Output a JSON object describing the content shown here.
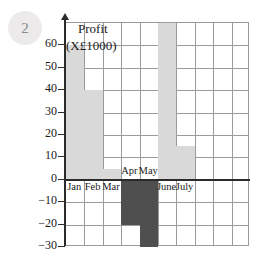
{
  "question": {
    "number": "2"
  },
  "chart_data": {
    "type": "bar",
    "title": "Profit",
    "subtitle": "(X£1000)",
    "xlabel": "",
    "ylabel": "",
    "categories": [
      "Jan",
      "Feb",
      "Mar",
      "Apr",
      "May",
      "June",
      "July"
    ],
    "values": [
      60,
      40,
      5,
      -20,
      -30,
      70,
      15
    ],
    "ylim": [
      -30,
      70
    ],
    "ytick_labels": [
      "60",
      "50",
      "40",
      "30",
      "20",
      "10",
      "0",
      "−10",
      "−20",
      "−30"
    ],
    "ytick_values": [
      60,
      50,
      40,
      30,
      20,
      10,
      0,
      -10,
      -20,
      -30
    ],
    "grid": true,
    "grid_columns": 10,
    "grid_rows": 10,
    "legend": "none",
    "colors": {
      "positive_bar": "#d9d9d9",
      "negative_bar": "#4f4f4f",
      "gridline": "#9b9b9b",
      "axis": "#2b2b2b",
      "text": "#1a1a1a",
      "badge_background": "#eceaea",
      "badge_text": "#8a8a8a"
    }
  }
}
